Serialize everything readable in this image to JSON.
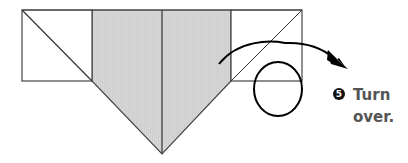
{
  "diagram": {
    "type": "origami-fold-step",
    "fill_color": "#d4d4d4",
    "line_color": "#333333",
    "arrow_color": "#000000"
  },
  "instruction": {
    "step_number": "5",
    "text": "Turn\nover."
  }
}
